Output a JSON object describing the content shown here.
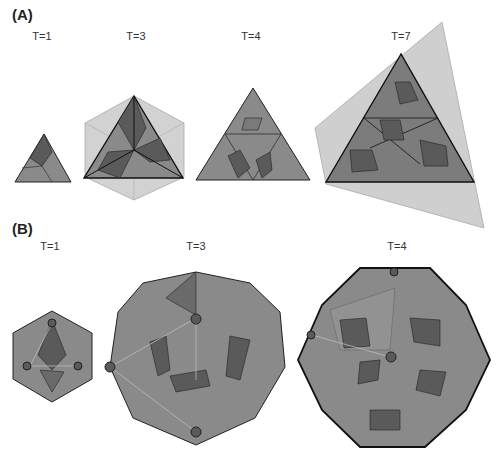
{
  "figure": {
    "panel_a": {
      "label": "(A)",
      "items": [
        {
          "t_label": "T=1",
          "shape": "triangle-face"
        },
        {
          "t_label": "T=3",
          "shape": "triangle-face-on-hexagon-lattice"
        },
        {
          "t_label": "T=4",
          "shape": "triangle-face"
        },
        {
          "t_label": "T=7",
          "shape": "triangle-face-on-skewed-lattice"
        }
      ]
    },
    "panel_b": {
      "label": "(B)",
      "items": [
        {
          "t_label": "T=1",
          "shape": "icosahedral-capsid"
        },
        {
          "t_label": "T=3",
          "shape": "icosahedral-capsid"
        },
        {
          "t_label": "T=4",
          "shape": "icosahedral-capsid"
        }
      ]
    },
    "colors": {
      "light": "#c8c8c8",
      "mid": "#8a8a8a",
      "dark": "#5a5a5a",
      "edge": "#111111"
    }
  }
}
